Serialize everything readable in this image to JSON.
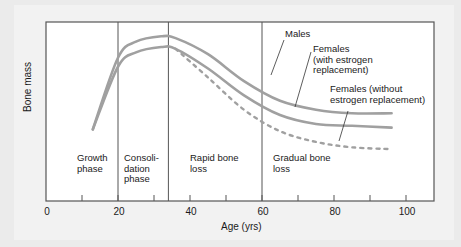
{
  "chart_data": {
    "type": "line",
    "title": "",
    "xlabel": "Age (yrs)",
    "ylabel": "Bone mass",
    "xlim": [
      0,
      108
    ],
    "x_ticks": [
      0,
      10,
      20,
      30,
      40,
      50,
      60,
      70,
      80,
      90,
      100
    ],
    "x_tick_labels": [
      "0",
      "20",
      "40",
      "60",
      "80",
      "100"
    ],
    "y_ticks": [],
    "grid": false,
    "legend_position": "inline annotations with leader lines",
    "phase_dividers": [
      20,
      34,
      60
    ],
    "phases": [
      {
        "label": "Growth\nphase",
        "line1": "Growth",
        "line2": "phase",
        "line3": ""
      },
      {
        "label": "Consoli-\ndation\nphase",
        "line1": "Consoli-",
        "line2": "dation",
        "line3": "phase"
      },
      {
        "label": "Rapid bone\nloss",
        "line1": "Rapid bone",
        "line2": "loss",
        "line3": ""
      },
      {
        "label": "Gradual bone\nloss",
        "line1": "Gradual bone",
        "line2": "loss",
        "line3": ""
      }
    ],
    "series": [
      {
        "name": "Males",
        "style": "solid",
        "x": [
          13,
          20,
          25,
          32,
          36,
          45,
          55,
          65,
          75,
          85,
          96
        ],
        "values": [
          0.4,
          0.8,
          0.89,
          0.92,
          0.91,
          0.82,
          0.67,
          0.56,
          0.51,
          0.49,
          0.49
        ]
      },
      {
        "name": "Females (with estrogen replacement)",
        "style": "solid",
        "x": [
          13,
          20,
          25,
          32,
          36,
          45,
          55,
          65,
          75,
          85,
          96
        ],
        "values": [
          0.4,
          0.75,
          0.83,
          0.86,
          0.85,
          0.74,
          0.59,
          0.48,
          0.43,
          0.42,
          0.41
        ]
      },
      {
        "name": "Females (without estrogen replacement)",
        "style": "dashed",
        "x": [
          36,
          45,
          55,
          65,
          75,
          85,
          96
        ],
        "values": [
          0.85,
          0.69,
          0.51,
          0.39,
          0.33,
          0.3,
          0.29
        ]
      }
    ],
    "annotations": [
      {
        "text": "Males",
        "lines": [
          "Males"
        ]
      },
      {
        "text": "Females (with estrogen replacement)",
        "lines": [
          "Females",
          "(with estrogen",
          "replacement)"
        ]
      },
      {
        "text": "Females (without estrogen replacement)",
        "lines": [
          "Females (without",
          "estrogen replacement)"
        ]
      }
    ]
  },
  "colors": {
    "curve": "#a0a0a0",
    "frame": "#555555",
    "text": "#1a1a1a"
  }
}
